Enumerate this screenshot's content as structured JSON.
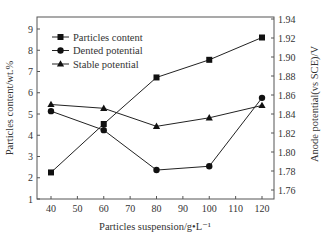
{
  "chart_data": {
    "type": "line",
    "title": "",
    "xlabel": "Particles suspension/g•L⁻¹",
    "ylabel": "Particles content/wt.%",
    "ylabel_right": "Anode potential(vs SCE)/V",
    "x": [
      40,
      60,
      80,
      100,
      120
    ],
    "xlim": [
      34,
      126
    ],
    "x_ticks": [
      40,
      50,
      60,
      70,
      80,
      90,
      100,
      110,
      120
    ],
    "ylim": [
      1,
      9.85
    ],
    "y_ticks": [
      1,
      2,
      3,
      4,
      5,
      6,
      7,
      8,
      9
    ],
    "ylim_right": [
      1.751,
      1.94
    ],
    "y_ticks_right": [
      "1.76",
      "1.78",
      "1.80",
      "1.82",
      "1.84",
      "1.86",
      "1.88",
      "1.90",
      "1.92",
      "1.94"
    ],
    "grid": false,
    "legend_position": "upper left",
    "series": [
      {
        "name": "Particles content",
        "axis": "left",
        "marker": "square",
        "values": [
          2.25,
          4.53,
          6.72,
          7.55,
          8.6
        ]
      },
      {
        "name": "Dented potential",
        "axis": "right",
        "marker": "circle",
        "values": [
          1.843,
          1.823,
          1.781,
          1.785,
          1.857
        ]
      },
      {
        "name": "Stable potential",
        "axis": "right",
        "marker": "triangle",
        "values": [
          1.85,
          1.846,
          1.827,
          1.836,
          1.849
        ]
      }
    ]
  }
}
